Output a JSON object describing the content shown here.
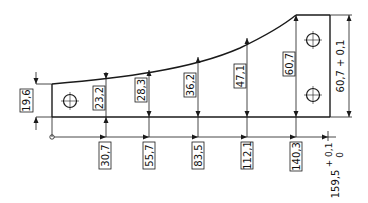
{
  "drawing": {
    "type": "technical dimension drawing (tapered plate with curved top edge)",
    "units": "mm",
    "origin_marker": "datum-circle",
    "left_height": "19,6",
    "right_height_label": "60,7 + 0,1",
    "total_length_value": "159,5",
    "total_length_tol_upper": "+ 0,1",
    "total_length_tol_lower": "0",
    "stations": [
      {
        "x_label": "30,7",
        "height_label": "23,2"
      },
      {
        "x_label": "55,7",
        "height_label": "28,3"
      },
      {
        "x_label": "83,5",
        "height_label": "36,2"
      },
      {
        "x_label": "112,1",
        "height_label": "47,1"
      },
      {
        "x_label": "140,3",
        "height_label": "60,7"
      }
    ],
    "holes": [
      {
        "name": "left-hole"
      },
      {
        "name": "right-top-hole"
      },
      {
        "name": "right-bottom-hole"
      }
    ],
    "colors": {
      "line": "#1a1a1a",
      "background": "#ffffff"
    }
  }
}
